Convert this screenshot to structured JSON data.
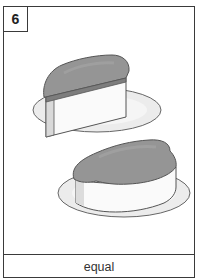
{
  "card": {
    "number": "6",
    "caption": "equal",
    "illustration": {
      "description": "two slices of cake with frosting on plates",
      "items": [
        {
          "name": "cake-slice-wedge",
          "shape": "wedge"
        },
        {
          "name": "cake-slice-round",
          "shape": "rounded"
        }
      ],
      "colors": {
        "frosting": "#8e8e8e",
        "cake": "#f4f4f4",
        "plate": "#e8e8e8",
        "outline": "#555555"
      }
    }
  }
}
